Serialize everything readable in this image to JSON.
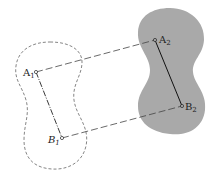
{
  "diagram": {
    "type": "rigid-body-translation",
    "colors": {
      "background": "#ffffff",
      "body2_fill": "#a9a9a9",
      "line": "#222222",
      "outline": "#555555"
    },
    "points": {
      "A1": {
        "label": "A",
        "sub": "1",
        "x": 36,
        "y": 72
      },
      "B1": {
        "label": "B",
        "sub": "1",
        "x": 62,
        "y": 138
      },
      "A2": {
        "label": "A",
        "sub": "2",
        "x": 155,
        "y": 40
      },
      "B2": {
        "label": "B",
        "sub": "2",
        "x": 182,
        "y": 106
      }
    },
    "bodies": [
      {
        "name": "initial-position",
        "style": "dashed-outline"
      },
      {
        "name": "final-position",
        "style": "filled-gray"
      }
    ],
    "segments": [
      {
        "from": "A1",
        "to": "B1",
        "style": "dash-dot"
      },
      {
        "from": "A2",
        "to": "B2",
        "style": "solid"
      },
      {
        "from": "A1",
        "to": "A2",
        "style": "long-dash"
      },
      {
        "from": "B1",
        "to": "B2",
        "style": "long-dash"
      }
    ]
  }
}
